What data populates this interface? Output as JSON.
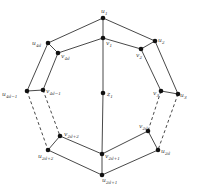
{
  "diagram": {
    "type": "graph",
    "width": 199,
    "height": 193,
    "colors": {
      "edge": "#333333",
      "node": "#111111",
      "label": "#444444",
      "background": "#ffffff"
    },
    "nodes": [
      {
        "id": "u1",
        "base": "u",
        "sub": "1",
        "x": 103,
        "y": 18,
        "lx": 101,
        "ly": 13
      },
      {
        "id": "v1",
        "base": "v",
        "sub": "1",
        "x": 103,
        "y": 38,
        "lx": 106,
        "ly": 45
      },
      {
        "id": "u2",
        "base": "u",
        "sub": "2",
        "x": 155,
        "y": 41,
        "lx": 158,
        "ly": 42
      },
      {
        "id": "v2",
        "base": "v",
        "sub": "2",
        "x": 141,
        "y": 49,
        "lx": 136,
        "ly": 57
      },
      {
        "id": "u3",
        "base": "u",
        "sub": "3",
        "x": 178,
        "y": 94,
        "lx": 180,
        "ly": 97
      },
      {
        "id": "v3",
        "base": "v",
        "sub": "3",
        "x": 161,
        "y": 91,
        "lx": 153,
        "ly": 95
      },
      {
        "id": "u4d",
        "base": "u",
        "sub": "4d",
        "x": 48,
        "y": 43,
        "lx": 32,
        "ly": 45
      },
      {
        "id": "v4d",
        "base": "v",
        "sub": "4d",
        "x": 58,
        "y": 53,
        "lx": 61,
        "ly": 58
      },
      {
        "id": "u4d-1",
        "base": "u",
        "sub": "4d−1",
        "x": 27,
        "y": 91,
        "lx": 2,
        "ly": 96
      },
      {
        "id": "v4d-1",
        "base": "v",
        "sub": "4d−1",
        "x": 43,
        "y": 90,
        "lx": 46,
        "ly": 93
      },
      {
        "id": "z1",
        "base": "z",
        "sub": "1",
        "x": 103,
        "y": 93,
        "lx": 107,
        "ly": 96
      },
      {
        "id": "v2d",
        "base": "v",
        "sub": "2d",
        "x": 148,
        "y": 131,
        "lx": 139,
        "ly": 128
      },
      {
        "id": "u2d",
        "base": "u",
        "sub": "2d",
        "x": 158,
        "y": 150,
        "lx": 161,
        "ly": 153
      },
      {
        "id": "v2d+1",
        "base": "v",
        "sub": "2d+1",
        "x": 102,
        "y": 154,
        "lx": 105,
        "ly": 158
      },
      {
        "id": "u2d+1",
        "base": "u",
        "sub": "2d+1",
        "x": 102,
        "y": 175,
        "lx": 102,
        "ly": 182
      },
      {
        "id": "v2d+2",
        "base": "v",
        "sub": "2d+2",
        "x": 60,
        "y": 136,
        "lx": 64,
        "ly": 136
      },
      {
        "id": "u2d+2",
        "base": "u",
        "sub": "2d+2",
        "x": 48,
        "y": 150,
        "lx": 38,
        "ly": 158
      }
    ],
    "edges": [
      {
        "from": "u1",
        "to": "u2",
        "style": "solid"
      },
      {
        "from": "u1",
        "to": "u4d",
        "style": "solid"
      },
      {
        "from": "u1",
        "to": "v1",
        "style": "solid"
      },
      {
        "from": "v1",
        "to": "v2",
        "style": "solid"
      },
      {
        "from": "v1",
        "to": "v4d",
        "style": "solid"
      },
      {
        "from": "v1",
        "to": "z1",
        "style": "solid"
      },
      {
        "from": "z1",
        "to": "v2d+1",
        "style": "solid"
      },
      {
        "from": "u2",
        "to": "v2",
        "style": "solid"
      },
      {
        "from": "u2",
        "to": "u3",
        "style": "solid"
      },
      {
        "from": "v2",
        "to": "v3",
        "style": "solid"
      },
      {
        "from": "v3",
        "to": "u3",
        "style": "solid"
      },
      {
        "from": "u4d",
        "to": "v4d",
        "style": "solid"
      },
      {
        "from": "u4d",
        "to": "u4d-1",
        "style": "solid"
      },
      {
        "from": "v4d",
        "to": "v4d-1",
        "style": "solid"
      },
      {
        "from": "u4d-1",
        "to": "v4d-1",
        "style": "solid"
      },
      {
        "from": "u4d-1",
        "to": "u2d+2",
        "style": "dashed"
      },
      {
        "from": "v4d-1",
        "to": "v2d+2",
        "style": "dashed"
      },
      {
        "from": "v3",
        "to": "v2d",
        "style": "dashed"
      },
      {
        "from": "u3",
        "to": "u2d",
        "style": "dashed"
      },
      {
        "from": "v2d+2",
        "to": "u2d+2",
        "style": "solid"
      },
      {
        "from": "v2d+2",
        "to": "v2d+1",
        "style": "solid"
      },
      {
        "from": "u2d+2",
        "to": "u2d+1",
        "style": "solid"
      },
      {
        "from": "v2d+1",
        "to": "u2d+1",
        "style": "solid"
      },
      {
        "from": "v2d+1",
        "to": "v2d",
        "style": "solid"
      },
      {
        "from": "u2d+1",
        "to": "u2d",
        "style": "solid"
      },
      {
        "from": "v2d",
        "to": "u2d",
        "style": "solid"
      }
    ]
  }
}
